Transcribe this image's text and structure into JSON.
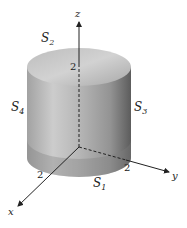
{
  "diagram": {
    "type": "3d-cylinder-surfaces",
    "axes": {
      "z": {
        "label": "z",
        "tick": "2"
      },
      "x": {
        "label": "x",
        "tick": "2"
      },
      "y": {
        "label": "y",
        "tick": "2"
      }
    },
    "surfaces": {
      "s1": {
        "label": "S",
        "sub": "1"
      },
      "s2": {
        "label": "S",
        "sub": "2"
      },
      "s3": {
        "label": "S",
        "sub": "3"
      },
      "s4": {
        "label": "S",
        "sub": "4"
      }
    },
    "colors": {
      "cylinder_light": "#d8d8d8",
      "cylinder_dark": "#6a6a6a",
      "top_face": "#c4c4c4",
      "axis": "#222222"
    }
  }
}
